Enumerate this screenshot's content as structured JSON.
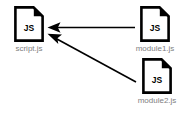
{
  "diagram": {
    "type": "dependency-graph",
    "background_color": "#ffffff",
    "icon_color": "#000000",
    "label_color": "#808080",
    "arrow_color": "#000000",
    "nodes": [
      {
        "id": "script",
        "label": "script.js",
        "icon": "js-file-icon",
        "icon_text": "JS"
      },
      {
        "id": "module1",
        "label": "module1.js",
        "icon": "js-file-icon",
        "icon_text": "JS"
      },
      {
        "id": "module2",
        "label": "module2.js",
        "icon": "js-file-icon",
        "icon_text": "JS"
      }
    ],
    "edges": [
      {
        "id": "module1-to-script",
        "from": "module1",
        "to": "script",
        "style": "solid-arrow",
        "direction": "right-to-left"
      },
      {
        "id": "module2-to-script",
        "from": "module2",
        "to": "script",
        "style": "solid-arrow",
        "direction": "diagonal-up-left"
      }
    ]
  }
}
